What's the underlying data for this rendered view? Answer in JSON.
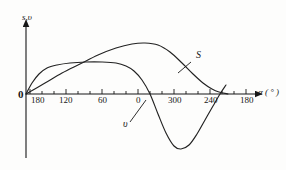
{
  "figure": {
    "axis_labels": {
      "y": "s,υ",
      "x": "α ( ° )"
    },
    "origin_label": "0",
    "curve_labels": {
      "s": "S",
      "v": "υ"
    },
    "colors": {
      "ink": "#171717",
      "curve": "#222222",
      "background": "#fdfdfc"
    }
  },
  "chart_data": {
    "type": "line",
    "title": "",
    "subtitle": "",
    "xlabel": "α ( ° )",
    "ylabel": "s,υ",
    "grid": false,
    "legend": "inline-annotations",
    "xlim": [
      0,
      720
    ],
    "ylim": [
      -1.05,
      1.25
    ],
    "x_tick_labels": [
      "180",
      "120",
      "60",
      "0",
      "300",
      "240",
      "180"
    ],
    "x_tick_positions_px": [
      30,
      66,
      102,
      138,
      174,
      210,
      246
    ],
    "x_minor_tick_step_px": 12,
    "axis_origin_px": [
      26,
      94
    ],
    "axis_x_end_px": 262,
    "axis_y_top_px": 22,
    "axis_y_bottom_px": 158,
    "series": [
      {
        "name": "S",
        "label": "S",
        "annotation": "S",
        "points_px": [
          [
            26,
            94
          ],
          [
            45,
            83
          ],
          [
            62,
            73
          ],
          [
            80,
            64
          ],
          [
            98,
            55
          ],
          [
            116,
            48
          ],
          [
            132,
            44
          ],
          [
            145,
            43
          ],
          [
            158,
            45
          ],
          [
            170,
            52
          ],
          [
            182,
            63
          ],
          [
            193,
            74
          ],
          [
            203,
            83
          ],
          [
            212,
            89
          ],
          [
            219,
            92
          ],
          [
            228,
            94
          ]
        ]
      },
      {
        "name": "v",
        "label": "υ",
        "annotation": "υ",
        "points_px": [
          [
            26,
            94
          ],
          [
            32,
            83
          ],
          [
            39,
            74
          ],
          [
            47,
            68
          ],
          [
            57,
            65
          ],
          [
            70,
            63
          ],
          [
            86,
            62
          ],
          [
            102,
            62
          ],
          [
            116,
            63
          ],
          [
            126,
            66
          ],
          [
            134,
            71
          ],
          [
            142,
            80
          ],
          [
            150,
            94
          ],
          [
            158,
            114
          ],
          [
            166,
            133
          ],
          [
            174,
            146
          ],
          [
            181,
            149
          ],
          [
            189,
            145
          ],
          [
            197,
            134
          ],
          [
            205,
            120
          ],
          [
            213,
            106
          ],
          [
            220,
            94
          ],
          [
            226,
            85
          ]
        ]
      }
    ],
    "annotations": [
      {
        "text": "S",
        "text_px": [
          196,
          57
        ],
        "leader_from_px": [
          191,
          62
        ],
        "leader_to_px": [
          178,
          73
        ]
      },
      {
        "text": "υ",
        "text_px": [
          124,
          125
        ],
        "leader_from_px": [
          130,
          122
        ],
        "leader_to_px": [
          146,
          100
        ]
      }
    ]
  }
}
